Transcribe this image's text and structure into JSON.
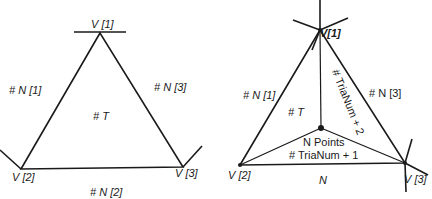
{
  "left_diagram": {
    "vertices": {
      "v1": "V [1]",
      "v2": "V [2]",
      "v3": "V [3]"
    },
    "neighbors": {
      "n1": "# N [1]",
      "n2": "# N [2]",
      "n3": "# N [3]"
    },
    "triangle": "# T"
  },
  "right_diagram": {
    "vertices": {
      "v1": "V[1]",
      "v2": "V [2]",
      "v3": "V [3]"
    },
    "neighbors": {
      "n1": "# N [1]",
      "n3": "# N [3]",
      "n": "N"
    },
    "triangle": "# T",
    "center_label_line1": "N Points",
    "center_label_line2": "# TriaNum + 1",
    "rotated_label": "# TriaNum + 2"
  },
  "colors": {
    "line": "#1a1a1a",
    "background": "#ffffff"
  }
}
